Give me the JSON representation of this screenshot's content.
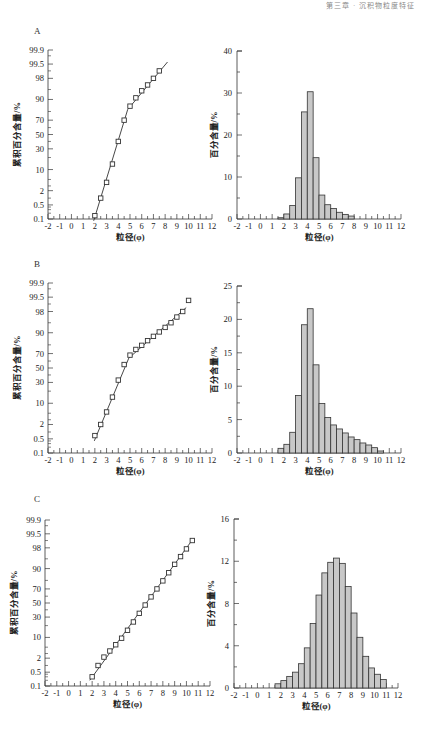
{
  "header": {
    "text": "第三章 · 沉积物粒度特征"
  },
  "panels": [
    {
      "letter": "A"
    },
    {
      "letter": "B"
    },
    {
      "letter": "C"
    }
  ],
  "axis_labels": {
    "cumulative_y": "累积百分含量/%",
    "frequency_y": "百分含量/%",
    "x": "粒径(φ)"
  },
  "prob_ticks": [
    "0.1",
    "0.5",
    "2",
    "10",
    "30",
    "50",
    "70",
    "90",
    "98",
    "99.5",
    "99.9"
  ],
  "prob_values": [
    0.1,
    0.5,
    2,
    10,
    30,
    50,
    70,
    90,
    98,
    99.5,
    99.9
  ],
  "x_ticks": [
    "-2",
    "-1",
    "0",
    "1",
    "2",
    "3",
    "4",
    "5",
    "6",
    "7",
    "8",
    "9",
    "10",
    "11",
    "12"
  ],
  "colors": {
    "bar_fill": "#c8c8c8",
    "bar_stroke": "#333333",
    "axis": "#333333",
    "line": "#333333"
  },
  "chart_data": [
    {
      "id": "A-cumulative",
      "type": "line",
      "title": "A",
      "xlabel": "粒径(φ)",
      "ylabel": "累积百分含量/%",
      "yscale": "probability",
      "xlim": [
        -2,
        12
      ],
      "ylim": [
        0.1,
        99.9
      ],
      "x": [
        2.0,
        2.5,
        3.0,
        3.5,
        4.0,
        4.5,
        5.0,
        5.5,
        6.0,
        6.5,
        7.0,
        7.5
      ],
      "values": [
        0.15,
        1.0,
        4.0,
        14.0,
        40.0,
        70.0,
        85.0,
        91.0,
        94.5,
        96.5,
        98.0,
        99.0
      ],
      "fit_line": [
        [
          1.9,
          0.08
        ],
        [
          4.8,
          82.0
        ],
        [
          8.2,
          99.6
        ]
      ],
      "grid": false
    },
    {
      "id": "A-frequency",
      "type": "bar",
      "title": "A",
      "xlabel": "粒径(φ)",
      "ylabel": "百分含量/%",
      "xlim": [
        -2,
        12
      ],
      "ylim": [
        0,
        40
      ],
      "y_ticks": [
        0,
        10,
        20,
        30,
        40
      ],
      "bin_width": 0.5,
      "bin_starts": [
        1.5,
        2.0,
        2.5,
        3.0,
        3.5,
        4.0,
        4.5,
        5.0,
        5.5,
        6.0,
        6.5,
        7.0,
        7.5
      ],
      "values": [
        0.3,
        1.2,
        3.2,
        9.8,
        25.5,
        30.3,
        14.6,
        5.7,
        3.4,
        2.5,
        1.6,
        1.1,
        0.7
      ],
      "grid": false
    },
    {
      "id": "B-cumulative",
      "type": "line",
      "title": "B",
      "xlabel": "粒径(φ)",
      "ylabel": "累积百分含量/%",
      "yscale": "probability",
      "xlim": [
        -2,
        12
      ],
      "ylim": [
        0.1,
        99.9
      ],
      "x": [
        2.0,
        2.5,
        3.0,
        3.5,
        4.0,
        4.5,
        5.0,
        5.5,
        6.0,
        6.5,
        7.0,
        7.5,
        8.0,
        8.5,
        9.0,
        9.5,
        10.0
      ],
      "values": [
        0.7,
        2.0,
        5.5,
        14.5,
        33.0,
        55.0,
        68.0,
        75.0,
        79.5,
        84.0,
        87.5,
        90.5,
        93.0,
        95.0,
        96.8,
        98.0,
        99.3
      ],
      "fit_line": [
        [
          1.95,
          0.4
        ],
        [
          4.9,
          64.0
        ],
        [
          9.8,
          98.6
        ]
      ],
      "grid": false
    },
    {
      "id": "B-frequency",
      "type": "bar",
      "title": "B",
      "xlabel": "粒径(φ)",
      "ylabel": "百分含量/%",
      "xlim": [
        -2,
        12
      ],
      "ylim": [
        0,
        25
      ],
      "y_ticks": [
        0,
        5,
        10,
        15,
        20,
        25
      ],
      "bin_width": 0.5,
      "bin_starts": [
        1.5,
        2.0,
        2.5,
        3.0,
        3.5,
        4.0,
        4.5,
        5.0,
        5.5,
        6.0,
        6.5,
        7.0,
        7.5,
        8.0,
        8.5,
        9.0,
        9.5,
        10.0
      ],
      "values": [
        0.7,
        1.3,
        3.1,
        8.6,
        19.2,
        21.6,
        13.2,
        7.4,
        5.3,
        4.2,
        3.6,
        3.0,
        2.4,
        2.0,
        1.5,
        1.2,
        0.8,
        0.3
      ],
      "grid": false
    },
    {
      "id": "C-cumulative",
      "type": "line",
      "title": "C",
      "xlabel": "粒径(φ)",
      "ylabel": "累积百分含量/%",
      "yscale": "probability",
      "xlim": [
        -2,
        12
      ],
      "ylim": [
        0.1,
        99.9
      ],
      "x": [
        2.0,
        2.5,
        3.0,
        3.5,
        4.0,
        4.5,
        5.0,
        5.5,
        6.0,
        6.5,
        7.0,
        7.5,
        8.0,
        8.5,
        9.0,
        9.5,
        10.0,
        10.5
      ],
      "values": [
        0.3,
        1.0,
        2.2,
        3.7,
        6.0,
        9.5,
        15.5,
        24.0,
        35.0,
        47.0,
        59.0,
        70.0,
        79.5,
        87.0,
        92.5,
        95.8,
        97.8,
        99.0
      ],
      "fit_line": [
        [
          1.8,
          0.2
        ],
        [
          10.6,
          99.2
        ]
      ],
      "grid": false
    },
    {
      "id": "C-frequency",
      "type": "bar",
      "title": "C",
      "xlabel": "粒径(φ)",
      "ylabel": "百分含量/%",
      "xlim": [
        -2,
        12
      ],
      "ylim": [
        0,
        16
      ],
      "y_ticks": [
        0,
        4,
        8,
        12,
        16
      ],
      "bin_width": 0.5,
      "bin_starts": [
        1.5,
        2.0,
        2.5,
        3.0,
        3.5,
        4.0,
        4.5,
        5.0,
        5.5,
        6.0,
        6.5,
        7.0,
        7.5,
        8.0,
        8.5,
        9.0,
        9.5,
        10.0,
        10.5
      ],
      "values": [
        0.4,
        0.7,
        1.1,
        1.5,
        2.3,
        3.8,
        6.1,
        8.8,
        10.9,
        11.9,
        12.3,
        11.8,
        9.6,
        7.1,
        4.8,
        3.0,
        1.9,
        1.3,
        0.8
      ],
      "grid": false
    }
  ]
}
